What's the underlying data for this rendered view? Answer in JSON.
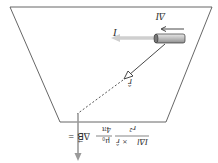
{
  "diagram": {
    "orientation": "upside-down",
    "labels": {
      "current_element": "ΔI⃗",
      "current": "I",
      "unit_vector": "r̂",
      "formula_lhs": "ΔB⃗ =",
      "formula_const_num": "μ₀",
      "formula_const_den": "4π",
      "formula_frac_num": "IΔl⃗ × r̂",
      "formula_frac_den": "r²"
    },
    "colors": {
      "outline": "#555555",
      "current_arrow": "#c8c8c8",
      "field_arrow": "#9a9a9a",
      "cylinder_fill": "#cfcfcf",
      "cylinder_edge": "#333333",
      "vector_line": "#333333"
    }
  }
}
